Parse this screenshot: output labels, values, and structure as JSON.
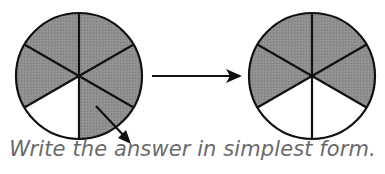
{
  "figure": {
    "left_circle": {
      "total_parts": 6,
      "shaded_parts": 4,
      "shaded_color": "#8c8c8c"
    },
    "right_circle": {
      "total_parts": 6,
      "shaded_parts": 4,
      "shaded_color": "#8c8c8c"
    },
    "arrow": "right-arrow"
  },
  "caption": "Write the answer in simplest form."
}
